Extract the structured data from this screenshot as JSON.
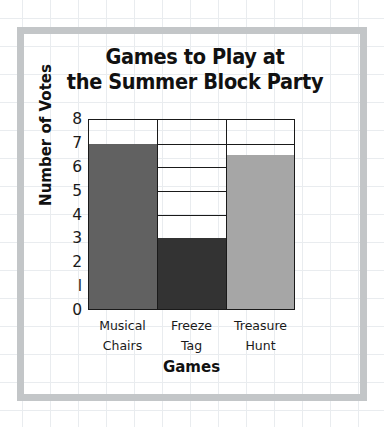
{
  "chart_data": {
    "type": "bar",
    "title": "Games to Play at the Summer Block Party",
    "title_lines": [
      "Games to Play at",
      "the Summer Block Party"
    ],
    "xlabel": "Games",
    "ylabel": "Number of Votes",
    "categories": [
      "Musical Chairs",
      "Freeze Tag",
      "Treasure Hunt"
    ],
    "category_lines": [
      [
        "Musical",
        "Chairs"
      ],
      [
        "Freeze",
        "Tag"
      ],
      [
        "Treasure",
        "Hunt"
      ]
    ],
    "values": [
      7,
      3,
      6.5
    ],
    "ylim": [
      0,
      8
    ],
    "ytick_labels": [
      "8",
      "7",
      "6",
      "5",
      "4",
      "3",
      "2",
      "l",
      "0"
    ],
    "ytick_values": [
      8,
      7,
      6,
      5,
      4,
      3,
      2,
      1,
      0
    ],
    "grid": true,
    "legend": false,
    "bar_colors": [
      "#616161",
      "#333333",
      "#a6a6a6"
    ],
    "axis_color": "#1a1a1a",
    "frame_color": "#c3c6c8",
    "grid_color": "#e9ecef"
  }
}
